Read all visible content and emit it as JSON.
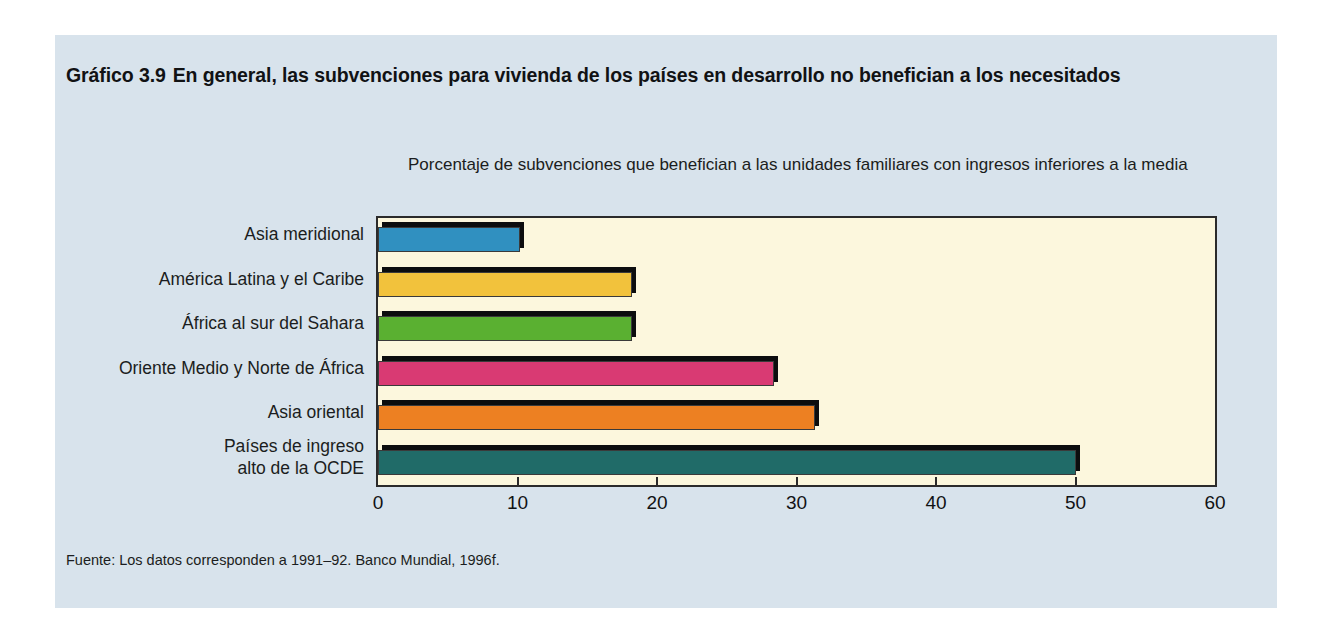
{
  "figure": {
    "number": "Gráfico 3.9",
    "title": "En general, las subvenciones para vivienda de los países en desarrollo no benefician a los necesitados",
    "subtitle": "Porcentaje de subvenciones que benefician a las unidades familiares con ingresos inferiores a la media",
    "source": "Fuente: Los datos corresponden a 1991–92. Banco Mundial, 1996f."
  },
  "colors": {
    "panel_background": "#d8e3ec",
    "plot_background": "#fcf7dd",
    "rule": "#111214",
    "frame": "#2b2b2b",
    "bar_shadow": "#0c0d0e"
  },
  "chart_data": {
    "type": "bar",
    "orientation": "horizontal",
    "subtitle": "Porcentaje de subvenciones que benefician a las unidades familiares con ingresos inferiores a la media",
    "xlabel": "",
    "ylabel": "",
    "xlim": [
      0,
      60
    ],
    "xticks": [
      0,
      10,
      20,
      30,
      40,
      50,
      60
    ],
    "xtick_labels": [
      "0",
      "10",
      "20",
      "30",
      "40",
      "50",
      "60"
    ],
    "grid": false,
    "legend": false,
    "categories": [
      "Asia meridional",
      "América Latina y el Caribe",
      "África al sur del Sahara",
      "Oriente Medio y Norte de África",
      "Asia oriental",
      "Países de ingreso alto de la OCDE"
    ],
    "values": [
      10.2,
      18.2,
      18.2,
      28.4,
      31.3,
      50.0
    ],
    "bar_colors": [
      "#3090c0",
      "#f2c23c",
      "#5ab031",
      "#d93a73",
      "#ed8022",
      "#206b68"
    ],
    "category_labels_wrapped": [
      [
        "Asia meridional"
      ],
      [
        "América Latina y el Caribe"
      ],
      [
        "África al sur del Sahara"
      ],
      [
        "Oriente Medio y Norte de África"
      ],
      [
        "Asia oriental"
      ],
      [
        "Países de ingreso",
        "alto de la OCDE"
      ]
    ],
    "source": "Fuente: Los datos corresponden a 1991–92. Banco Mundial, 1996f."
  }
}
